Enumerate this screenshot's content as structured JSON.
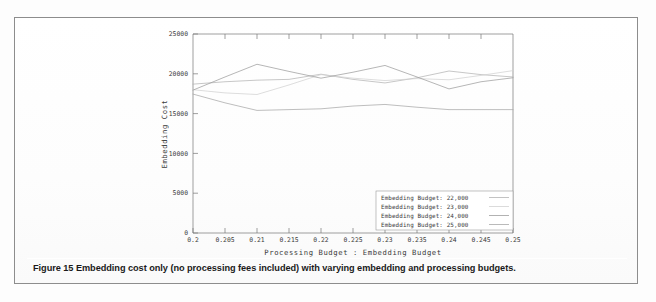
{
  "figure": {
    "caption_label": "Figure 15",
    "caption_text": "Embedding cost only (no processing fees included) with varying embedding and processing budgets."
  },
  "chart_data": {
    "type": "line",
    "title": "",
    "xlabel": "Processing Budget : Embedding Budget",
    "ylabel": "Embedding Cost",
    "x": [
      0.2,
      0.205,
      0.21,
      0.215,
      0.22,
      0.225,
      0.23,
      0.235,
      0.24,
      0.245,
      0.25
    ],
    "xtick_labels": [
      "0.2",
      "0.205",
      "0.21",
      "0.215",
      "0.22",
      "0.225",
      "0.23",
      "0.235",
      "0.24",
      "0.245",
      "0.25"
    ],
    "ytick_labels": [
      "0",
      "5000",
      "10000",
      "15000",
      "20000",
      "25000"
    ],
    "yticks": [
      0,
      5000,
      10000,
      15000,
      20000,
      25000
    ],
    "xlim": [
      0.2,
      0.25
    ],
    "ylim": [
      0,
      25000
    ],
    "grid": false,
    "legend_position": "bottom-right",
    "series": [
      {
        "name": "Embedding Budget: 22,000",
        "color": "#b4b4b4",
        "values": [
          18700,
          19000,
          19200,
          19300,
          19950,
          19300,
          18850,
          19500,
          20350,
          19900,
          19600
        ]
      },
      {
        "name": "Embedding Budget: 23,000",
        "color": "#d2d2d2",
        "values": [
          18000,
          17600,
          17400,
          18600,
          19900,
          19450,
          19150,
          19400,
          19250,
          19800,
          20400
        ]
      },
      {
        "name": "Embedding Budget: 24,000",
        "color": "#9e9e9e",
        "values": [
          17950,
          19600,
          21200,
          20300,
          19450,
          20200,
          21050,
          19600,
          18100,
          19000,
          19500
        ]
      },
      {
        "name": "Embedding Budget: 25,000",
        "color": "#a8a8a8",
        "values": [
          17450,
          16350,
          15400,
          15500,
          15600,
          15950,
          16150,
          15800,
          15500,
          15500,
          15500
        ]
      }
    ]
  }
}
